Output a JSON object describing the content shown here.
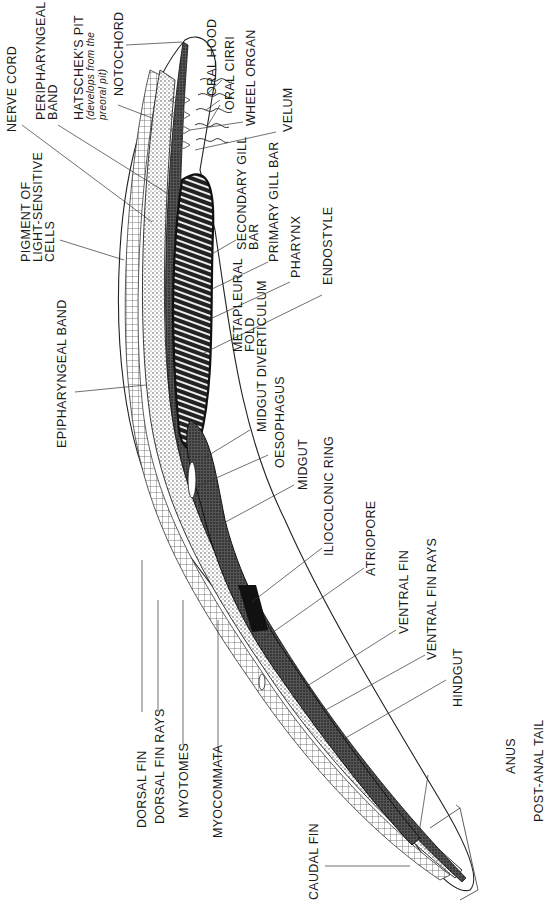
{
  "figure": {
    "labels": {
      "nerve_cord": "NERVE CORD",
      "peripharyngeal_band_1": "PERIPHARYNGEAL",
      "peripharyngeal_band_2": "BAND",
      "hatschek_pit": "HATSCHEK'S PIT",
      "hatschek_note_1": "(develops from the",
      "hatschek_note_2": "preoral pit)",
      "notochord": "NOTOCHORD",
      "oral_hood": "ORAL HOOD",
      "oral_cirri": "ORAL CIRRI",
      "wheel_organ": "WHEEL ORGAN",
      "velum": "VELUM",
      "pigment_1": "PIGMENT OF",
      "pigment_2": "LIGHT-SENSITIVE",
      "pigment_3": "CELLS",
      "secondary_gill_bar_1": "SECONDARY GILL",
      "secondary_gill_bar_2": "BAR",
      "primary_gill_bar": "PRIMARY GILL BAR",
      "pharynx": "PHARYNX",
      "endostyle": "ENDOSTYLE",
      "epipharyngeal_band": "EPIPHARYNGEAL BAND",
      "metapleural_fold_1": "METAPLEURAL",
      "metapleural_fold_2": "FOLD",
      "midgut_diverticulum": "MIDGUT DIVERTICULUM",
      "oesophagus": "OESOPHAGUS",
      "midgut": "MIDGUT",
      "iliocolonic_ring": "ILIOCOLONIC RING",
      "atriopore": "ATRIOPORE",
      "ventral_fin": "VENTRAL FIN",
      "ventral_fin_rays": "VENTRAL FIN RAYS",
      "hindgut": "HINDGUT",
      "dorsal_fin": "DORSAL FIN",
      "dorsal_fin_rays": "DORSAL FIN RAYS",
      "myotomes": "MYOTOMES",
      "myocommata": "MYOCOMMATA",
      "anus": "ANUS",
      "post_anal_tail": "POST-ANAL TAIL",
      "caudal_fin": "CAUDAL FIN"
    },
    "colors": {
      "ink": "#1a1a1a",
      "stipple": "#555555",
      "paper": "#ffffff"
    }
  }
}
